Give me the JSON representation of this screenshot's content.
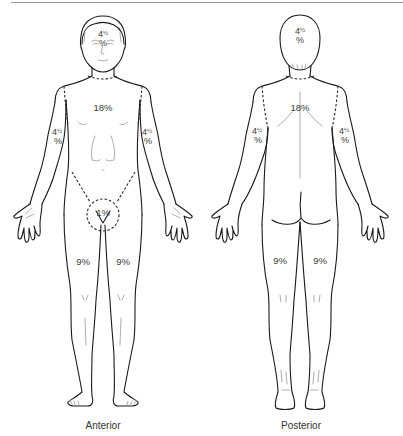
{
  "figure": {
    "views": [
      {
        "name": "Anterior",
        "caption": "Anterior",
        "regions": {
          "head": {
            "whole": "4",
            "frac": "½",
            "pct": "%"
          },
          "trunk": "18%",
          "left_arm": {
            "whole": "4",
            "frac": "½",
            "pct": "%"
          },
          "right_arm": {
            "whole": "4",
            "frac": "½",
            "pct": "%"
          },
          "perineum": "1%",
          "left_leg": "9%",
          "right_leg": "9%"
        }
      },
      {
        "name": "Posterior",
        "caption": "Posterior",
        "regions": {
          "head": {
            "whole": "4",
            "frac": "½",
            "pct": "%"
          },
          "trunk": "18%",
          "left_arm": {
            "whole": "4",
            "frac": "½",
            "pct": "%"
          },
          "right_arm": {
            "whole": "4",
            "frac": "½",
            "pct": "%"
          },
          "left_leg": "9%",
          "right_leg": "9%"
        }
      }
    ]
  },
  "colors": {
    "outline": "#1a1a1a",
    "label": "#3a3a3a",
    "rule": "#9c9c9c",
    "background": "#ffffff"
  }
}
